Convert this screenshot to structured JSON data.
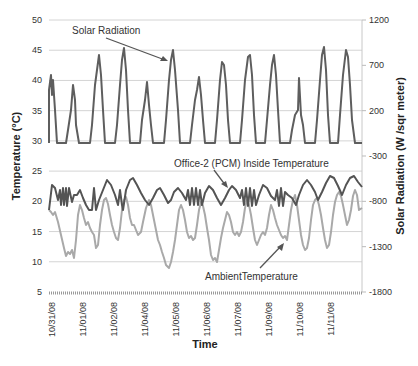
{
  "chart_data": {
    "type": "line",
    "title": "",
    "xlabel": "Time",
    "ylabel": "Temperature (°C)",
    "y2label": "Solar Radiation (W /sqr meter)",
    "ylim": [
      5,
      50
    ],
    "y2lim": [
      -1800,
      1200
    ],
    "yticks": [
      5,
      10,
      15,
      20,
      25,
      30,
      35,
      40,
      45,
      50
    ],
    "y2ticks": [
      -1800,
      -1300,
      -800,
      -300,
      200,
      700,
      1200
    ],
    "x_tick_labels": [
      "10/31/08",
      "11/01/08",
      "11/02/08",
      "11/04/08",
      "11/05/08",
      "11/06/08",
      "11/07/08",
      "11/09/08",
      "11/10/08",
      "11/11/08"
    ],
    "grid": true,
    "legend": "none (inline annotations)",
    "annotations": [
      "Solar Radiation",
      "Office-2 (PCM) Inside Temperature",
      "AmbientTemperature"
    ],
    "series": [
      {
        "name": "Solar Radiation",
        "axis": "right",
        "color": "#5a5a5a",
        "daily_peaks_temp_axis_equiv": [
          43,
          39.5,
          43.5,
          45,
          38.5,
          44.5,
          40,
          42.5,
          44,
          43.5,
          39.5,
          45.5,
          44.5
        ],
        "baseline_temp_axis_equiv": 29.5
      },
      {
        "name": "Office-2 (PCM) Inside Temperature",
        "axis": "left",
        "color": "#555555",
        "range_approx": [
          17.5,
          23.5
        ]
      },
      {
        "name": "AmbientTemperature",
        "axis": "left",
        "color": "#a8a8a8",
        "range_approx": [
          8.5,
          22.5
        ]
      }
    ]
  },
  "plot": {
    "x0": 49,
    "x1": 362,
    "y_top": 20,
    "y_bottom": 292
  },
  "solar_points": [
    [
      49,
      143
    ],
    [
      49,
      90
    ],
    [
      51,
      75
    ],
    [
      52,
      95
    ],
    [
      53,
      80
    ],
    [
      55,
      110
    ],
    [
      57,
      143
    ],
    [
      66,
      143
    ],
    [
      68,
      130
    ],
    [
      71,
      110
    ],
    [
      73,
      85
    ],
    [
      75,
      100
    ],
    [
      76,
      125
    ],
    [
      79,
      143
    ],
    [
      90,
      143
    ],
    [
      92,
      125
    ],
    [
      95,
      85
    ],
    [
      97,
      70
    ],
    [
      99,
      55
    ],
    [
      101,
      75
    ],
    [
      103,
      110
    ],
    [
      105,
      143
    ],
    [
      115,
      143
    ],
    [
      117,
      125
    ],
    [
      120,
      85
    ],
    [
      122,
      60
    ],
    [
      124,
      48
    ],
    [
      126,
      70
    ],
    [
      128,
      110
    ],
    [
      130,
      143
    ],
    [
      140,
      143
    ],
    [
      142,
      120
    ],
    [
      145,
      100
    ],
    [
      147,
      82
    ],
    [
      149,
      105
    ],
    [
      151,
      125
    ],
    [
      153,
      143
    ],
    [
      164,
      143
    ],
    [
      166,
      120
    ],
    [
      169,
      80
    ],
    [
      171,
      60
    ],
    [
      173,
      50
    ],
    [
      175,
      70
    ],
    [
      178,
      110
    ],
    [
      180,
      143
    ],
    [
      190,
      143
    ],
    [
      192,
      125
    ],
    [
      195,
      100
    ],
    [
      197,
      90
    ],
    [
      199,
      77
    ],
    [
      201,
      95
    ],
    [
      203,
      120
    ],
    [
      205,
      143
    ],
    [
      215,
      143
    ],
    [
      217,
      120
    ],
    [
      220,
      80
    ],
    [
      222,
      62
    ],
    [
      224,
      65
    ],
    [
      226,
      85
    ],
    [
      228,
      120
    ],
    [
      230,
      143
    ],
    [
      240,
      143
    ],
    [
      242,
      120
    ],
    [
      245,
      80
    ],
    [
      248,
      57
    ],
    [
      250,
      55
    ],
    [
      252,
      75
    ],
    [
      254,
      115
    ],
    [
      256,
      143
    ],
    [
      265,
      143
    ],
    [
      267,
      120
    ],
    [
      270,
      85
    ],
    [
      272,
      65
    ],
    [
      274,
      55
    ],
    [
      276,
      75
    ],
    [
      278,
      110
    ],
    [
      280,
      143
    ],
    [
      290,
      143
    ],
    [
      292,
      130
    ],
    [
      295,
      115
    ],
    [
      298,
      110
    ],
    [
      299,
      78
    ],
    [
      301,
      115
    ],
    [
      303,
      125
    ],
    [
      305,
      143
    ],
    [
      315,
      143
    ],
    [
      317,
      120
    ],
    [
      320,
      80
    ],
    [
      322,
      55
    ],
    [
      324,
      47
    ],
    [
      326,
      70
    ],
    [
      328,
      115
    ],
    [
      330,
      143
    ],
    [
      338,
      143
    ],
    [
      340,
      115
    ],
    [
      343,
      75
    ],
    [
      346,
      50
    ],
    [
      348,
      57
    ],
    [
      350,
      85
    ],
    [
      352,
      120
    ],
    [
      355,
      143
    ],
    [
      362,
      143
    ]
  ],
  "inside_points": [
    [
      49,
      210
    ],
    [
      52,
      185
    ],
    [
      55,
      188
    ],
    [
      58,
      200
    ],
    [
      60,
      190
    ],
    [
      61,
      205
    ],
    [
      63,
      188
    ],
    [
      64,
      205
    ],
    [
      66,
      188
    ],
    [
      67,
      206
    ],
    [
      69,
      188
    ],
    [
      72,
      202
    ],
    [
      74,
      195
    ],
    [
      77,
      195
    ],
    [
      80,
      190
    ],
    [
      83,
      198
    ],
    [
      86,
      205
    ],
    [
      89,
      210
    ],
    [
      92,
      210
    ],
    [
      94,
      188
    ],
    [
      96,
      210
    ],
    [
      99,
      200
    ],
    [
      103,
      190
    ],
    [
      107,
      180
    ],
    [
      111,
      185
    ],
    [
      115,
      195
    ],
    [
      118,
      205
    ],
    [
      120,
      190
    ],
    [
      122,
      205
    ],
    [
      123,
      210
    ],
    [
      126,
      190
    ],
    [
      130,
      180
    ],
    [
      133,
      178
    ],
    [
      137,
      185
    ],
    [
      141,
      193
    ],
    [
      145,
      200
    ],
    [
      149,
      205
    ],
    [
      153,
      198
    ],
    [
      157,
      190
    ],
    [
      160,
      188
    ],
    [
      164,
      195
    ],
    [
      168,
      203
    ],
    [
      171,
      200
    ],
    [
      174,
      192
    ],
    [
      178,
      188
    ],
    [
      182,
      193
    ],
    [
      186,
      200
    ],
    [
      188,
      190
    ],
    [
      190,
      205
    ],
    [
      192,
      188
    ],
    [
      194,
      205
    ],
    [
      196,
      188
    ],
    [
      198,
      205
    ],
    [
      200,
      190
    ],
    [
      202,
      205
    ],
    [
      205,
      193
    ],
    [
      209,
      186
    ],
    [
      213,
      190
    ],
    [
      217,
      198
    ],
    [
      221,
      205
    ],
    [
      225,
      198
    ],
    [
      229,
      190
    ],
    [
      232,
      186
    ],
    [
      236,
      190
    ],
    [
      240,
      198
    ],
    [
      242,
      190
    ],
    [
      244,
      205
    ],
    [
      246,
      188
    ],
    [
      248,
      206
    ],
    [
      250,
      188
    ],
    [
      252,
      206
    ],
    [
      254,
      190
    ],
    [
      256,
      205
    ],
    [
      259,
      195
    ],
    [
      263,
      185
    ],
    [
      267,
      188
    ],
    [
      271,
      196
    ],
    [
      275,
      200
    ],
    [
      277,
      190
    ],
    [
      279,
      206
    ],
    [
      281,
      188
    ],
    [
      283,
      206
    ],
    [
      285,
      192
    ],
    [
      288,
      195
    ],
    [
      292,
      198
    ],
    [
      296,
      205
    ],
    [
      299,
      195
    ],
    [
      303,
      185
    ],
    [
      307,
      180
    ],
    [
      311,
      185
    ],
    [
      315,
      192
    ],
    [
      318,
      200
    ],
    [
      322,
      192
    ],
    [
      326,
      183
    ],
    [
      330,
      176
    ],
    [
      334,
      178
    ],
    [
      338,
      186
    ],
    [
      342,
      195
    ],
    [
      346,
      185
    ],
    [
      350,
      178
    ],
    [
      354,
      176
    ],
    [
      358,
      182
    ],
    [
      362,
      187
    ]
  ],
  "ambient_points": [
    [
      49,
      210
    ],
    [
      51,
      212
    ],
    [
      53,
      215
    ],
    [
      55,
      212
    ],
    [
      58,
      222
    ],
    [
      61,
      235
    ],
    [
      64,
      248
    ],
    [
      66,
      256
    ],
    [
      68,
      252
    ],
    [
      70,
      254
    ],
    [
      72,
      250
    ],
    [
      74,
      258
    ],
    [
      76,
      240
    ],
    [
      78,
      215
    ],
    [
      80,
      205
    ],
    [
      82,
      210
    ],
    [
      84,
      218
    ],
    [
      86,
      225
    ],
    [
      88,
      222
    ],
    [
      90,
      228
    ],
    [
      92,
      232
    ],
    [
      94,
      235
    ],
    [
      96,
      248
    ],
    [
      98,
      245
    ],
    [
      100,
      225
    ],
    [
      102,
      210
    ],
    [
      104,
      200
    ],
    [
      106,
      198
    ],
    [
      108,
      204
    ],
    [
      110,
      215
    ],
    [
      112,
      225
    ],
    [
      114,
      232
    ],
    [
      116,
      238
    ],
    [
      118,
      240
    ],
    [
      120,
      228
    ],
    [
      122,
      210
    ],
    [
      124,
      200
    ],
    [
      126,
      197
    ],
    [
      128,
      205
    ],
    [
      130,
      218
    ],
    [
      132,
      225
    ],
    [
      134,
      225
    ],
    [
      136,
      230
    ],
    [
      138,
      235
    ],
    [
      141,
      232
    ],
    [
      143,
      222
    ],
    [
      146,
      208
    ],
    [
      149,
      200
    ],
    [
      151,
      205
    ],
    [
      153,
      215
    ],
    [
      156,
      230
    ],
    [
      158,
      240
    ],
    [
      160,
      245
    ],
    [
      162,
      252
    ],
    [
      164,
      258
    ],
    [
      166,
      265
    ],
    [
      169,
      268
    ],
    [
      171,
      262
    ],
    [
      173,
      252
    ],
    [
      175,
      240
    ],
    [
      177,
      225
    ],
    [
      179,
      210
    ],
    [
      181,
      205
    ],
    [
      183,
      210
    ],
    [
      185,
      220
    ],
    [
      187,
      232
    ],
    [
      189,
      238
    ],
    [
      191,
      236
    ],
    [
      193,
      240
    ],
    [
      195,
      238
    ],
    [
      197,
      225
    ],
    [
      199,
      210
    ],
    [
      201,
      202
    ],
    [
      203,
      206
    ],
    [
      205,
      215
    ],
    [
      207,
      228
    ],
    [
      209,
      240
    ],
    [
      211,
      255
    ],
    [
      213,
      260
    ],
    [
      215,
      258
    ],
    [
      217,
      262
    ],
    [
      219,
      250
    ],
    [
      221,
      238
    ],
    [
      223,
      228
    ],
    [
      225,
      220
    ],
    [
      227,
      212
    ],
    [
      229,
      215
    ],
    [
      231,
      222
    ],
    [
      233,
      232
    ],
    [
      235,
      235
    ],
    [
      237,
      232
    ],
    [
      239,
      236
    ],
    [
      241,
      232
    ],
    [
      243,
      222
    ],
    [
      245,
      208
    ],
    [
      247,
      200
    ],
    [
      249,
      205
    ],
    [
      251,
      215
    ],
    [
      253,
      228
    ],
    [
      255,
      240
    ],
    [
      257,
      245
    ],
    [
      259,
      240
    ],
    [
      261,
      235
    ],
    [
      263,
      232
    ],
    [
      265,
      235
    ],
    [
      267,
      228
    ],
    [
      269,
      215
    ],
    [
      271,
      205
    ],
    [
      273,
      210
    ],
    [
      275,
      218
    ],
    [
      277,
      225
    ],
    [
      279,
      230
    ],
    [
      281,
      235
    ],
    [
      283,
      238
    ],
    [
      285,
      236
    ],
    [
      287,
      240
    ],
    [
      289,
      225
    ],
    [
      291,
      210
    ],
    [
      293,
      200
    ],
    [
      295,
      195
    ],
    [
      297,
      205
    ],
    [
      299,
      220
    ],
    [
      301,
      235
    ],
    [
      303,
      245
    ],
    [
      305,
      250
    ],
    [
      307,
      248
    ],
    [
      309,
      238
    ],
    [
      311,
      220
    ],
    [
      313,
      205
    ],
    [
      315,
      200
    ],
    [
      317,
      198
    ],
    [
      319,
      205
    ],
    [
      321,
      215
    ],
    [
      323,
      228
    ],
    [
      325,
      240
    ],
    [
      327,
      248
    ],
    [
      329,
      245
    ],
    [
      331,
      232
    ],
    [
      333,
      215
    ],
    [
      335,
      202
    ],
    [
      337,
      195
    ],
    [
      339,
      192
    ],
    [
      341,
      196
    ],
    [
      343,
      205
    ],
    [
      345,
      215
    ],
    [
      347,
      225
    ],
    [
      349,
      220
    ],
    [
      351,
      210
    ],
    [
      353,
      196
    ],
    [
      355,
      190
    ],
    [
      357,
      195
    ],
    [
      359,
      210
    ],
    [
      362,
      208
    ]
  ]
}
